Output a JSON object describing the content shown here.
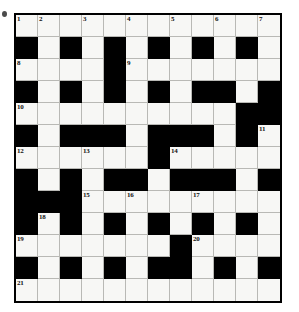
{
  "puzzle": {
    "title": "Crossword Grid",
    "type": "crossword",
    "rows": 12,
    "cols": 12,
    "cell_size_px": 22,
    "colors": {
      "block": "#000000",
      "cell": "#f7f7f5",
      "grid_line": "#b9b9b5",
      "border": "#000000",
      "number_text": "#101010",
      "page_background": "#ffffff"
    },
    "legend": {
      "block_char": "#",
      "open_char": "."
    },
    "grid": [
      "............",
      "#.#.#.#.#.#.",
      "....#.......",
      "#.#.#.#.##.#",
      "..........##",
      "#.###.###.#.",
      "......#.....",
      "#.#.##.###.#",
      "###.........",
      "#.#.#.#.#.#.",
      ".......#....",
      "#.#.#.##.#.#",
      "............"
    ],
    "numbers": [
      {
        "n": "1",
        "row": 0,
        "col": 0
      },
      {
        "n": "2",
        "row": 0,
        "col": 1
      },
      {
        "n": "3",
        "row": 0,
        "col": 3
      },
      {
        "n": "4",
        "row": 0,
        "col": 5
      },
      {
        "n": "5",
        "row": 0,
        "col": 7
      },
      {
        "n": "6",
        "row": 0,
        "col": 9
      },
      {
        "n": "7",
        "row": 0,
        "col": 11
      },
      {
        "n": "8",
        "row": 2,
        "col": 0
      },
      {
        "n": "9",
        "row": 2,
        "col": 5
      },
      {
        "n": "10",
        "row": 4,
        "col": 0
      },
      {
        "n": "11",
        "row": 5,
        "col": 11
      },
      {
        "n": "12",
        "row": 6,
        "col": 0
      },
      {
        "n": "13",
        "row": 6,
        "col": 3
      },
      {
        "n": "14",
        "row": 6,
        "col": 7
      },
      {
        "n": "15",
        "row": 8,
        "col": 3
      },
      {
        "n": "16",
        "row": 8,
        "col": 5
      },
      {
        "n": "17",
        "row": 8,
        "col": 8
      },
      {
        "n": "18",
        "row": 9,
        "col": 1
      },
      {
        "n": "19",
        "row": 10,
        "col": 0
      },
      {
        "n": "20",
        "row": 10,
        "col": 8
      },
      {
        "n": "21",
        "row": 12,
        "col": 0
      }
    ]
  }
}
